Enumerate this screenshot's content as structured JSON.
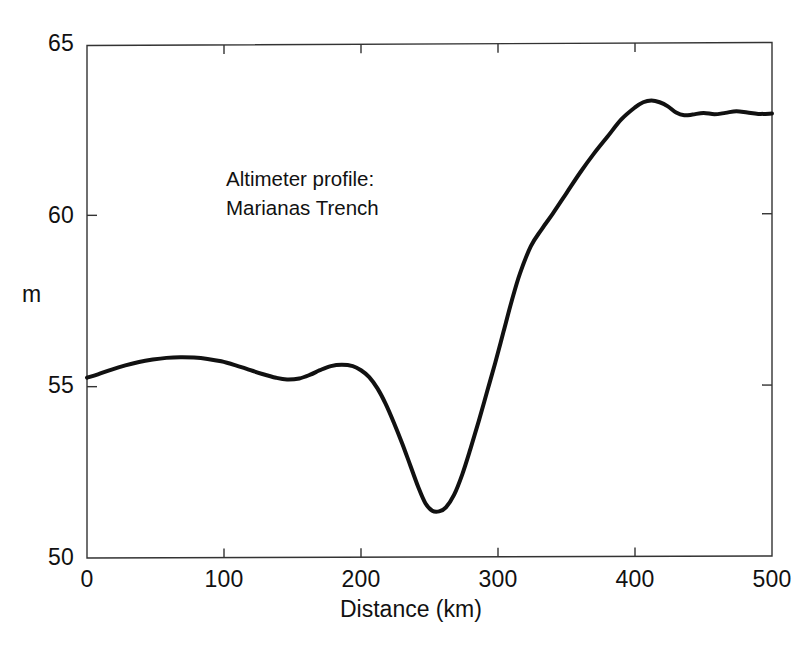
{
  "chart_data": {
    "type": "line",
    "title": "",
    "xlabel": "Distance (km)",
    "ylabel": "m",
    "xlim": [
      0,
      500
    ],
    "ylim": [
      50,
      65
    ],
    "xticks": [
      0,
      100,
      200,
      300,
      400,
      500
    ],
    "xtick_labels": [
      "0",
      "100",
      "200",
      "300",
      "400",
      "500"
    ],
    "yticks": [
      50,
      55,
      60,
      65
    ],
    "ytick_labels": [
      "50",
      "55",
      "60",
      "65"
    ],
    "grid": false,
    "legend": null,
    "annotations": [
      {
        "name": "series-annotation",
        "lines": [
          "Altimeter profile:",
          "Marianas Trench"
        ],
        "x_km": 102,
        "y_m": 61.3
      }
    ],
    "line_color": "#111111",
    "line_width_px": 4,
    "series": [
      {
        "name": "Altimeter profile: Marianas Trench",
        "x": [
          0,
          8,
          18,
          28,
          38,
          48,
          58,
          68,
          78,
          88,
          98,
          108,
          118,
          128,
          138,
          146,
          155,
          163,
          170,
          178,
          186,
          194,
          200,
          206,
          212,
          218,
          224,
          230,
          236,
          242,
          247,
          252,
          257,
          262,
          268,
          274,
          280,
          286,
          292,
          298,
          304,
          310,
          316,
          324,
          332,
          340,
          350,
          360,
          370,
          380,
          390,
          400,
          406,
          412,
          418,
          424,
          430,
          436,
          442,
          450,
          458,
          466,
          474,
          482,
          490,
          500
        ],
        "y": [
          55.26,
          55.36,
          55.5,
          55.62,
          55.72,
          55.79,
          55.84,
          55.86,
          55.85,
          55.81,
          55.74,
          55.63,
          55.5,
          55.37,
          55.26,
          55.21,
          55.24,
          55.35,
          55.48,
          55.6,
          55.64,
          55.6,
          55.48,
          55.28,
          54.95,
          54.5,
          53.95,
          53.35,
          52.7,
          52.05,
          51.6,
          51.38,
          51.36,
          51.48,
          51.85,
          52.45,
          53.2,
          54.0,
          54.85,
          55.7,
          56.6,
          57.5,
          58.3,
          59.1,
          59.6,
          60.05,
          60.65,
          61.25,
          61.8,
          62.3,
          62.8,
          63.15,
          63.3,
          63.35,
          63.3,
          63.18,
          63.0,
          62.92,
          62.94,
          62.99,
          62.95,
          62.99,
          63.04,
          63.0,
          62.96,
          62.97
        ]
      }
    ]
  },
  "axes_geometry": {
    "plot_left_px": 87,
    "plot_right_px": 772,
    "plot_top_px": 44,
    "plot_bottom_px": 558
  }
}
